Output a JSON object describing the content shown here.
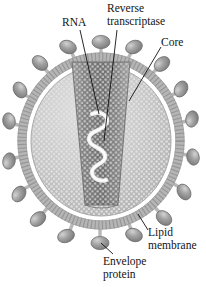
{
  "figure": {
    "type": "biological-diagram",
    "palette": {
      "background": "#ffffff",
      "text": "#131313",
      "leader_line": "#111111",
      "membrane_outer": "#b8b8b8",
      "membrane_inner": "#cfcfcf",
      "matrix_fill": "#c9c9c9",
      "core_dark": "#6f6f6f",
      "core_mid": "#8d8d8d",
      "core_light": "#a9a9a9",
      "rna_strand": "#e8e8e8",
      "envelope_protein": "#9c9c9c",
      "envelope_protein_highlight": "#c6c6c6",
      "envelope_protein_outline": "#6a6a6a"
    }
  },
  "labels": {
    "rna": "RNA",
    "reverse_transcriptase_line1": "Reverse",
    "reverse_transcriptase_line2": "transcriptase",
    "core": "Core",
    "lipid_membrane_line1": "Lipid",
    "lipid_membrane_line2": "membrane",
    "envelope_protein_line1": "Envelope",
    "envelope_protein_line2": "protein"
  },
  "structures": {
    "virion": {
      "center_x": 101,
      "center_y": 141,
      "radius_x": 79,
      "radius_y": 84
    },
    "lipid_membrane": {
      "thickness": 9,
      "spike_count": 76
    },
    "core": {
      "shape": "conical",
      "top_width": 58,
      "bottom_width": 34,
      "top_y": 62,
      "bottom_y": 205,
      "texture": "granular-dots"
    },
    "rna": {
      "shape": "s-curve-squiggle",
      "turns": 4
    },
    "envelope_proteins": {
      "count": 20,
      "shape": "ellipse",
      "width": 15,
      "height": 11
    }
  },
  "callouts": [
    {
      "name": "rna",
      "target_x": 99,
      "target_y": 112
    },
    {
      "name": "reverse-transcriptase",
      "target_x": 104,
      "target_y": 141
    },
    {
      "name": "core",
      "target_x": 129,
      "target_y": 101
    },
    {
      "name": "lipid-membrane",
      "target_x": 145,
      "target_y": 212
    },
    {
      "name": "envelope-protein",
      "target_x": 100,
      "target_y": 243
    }
  ]
}
